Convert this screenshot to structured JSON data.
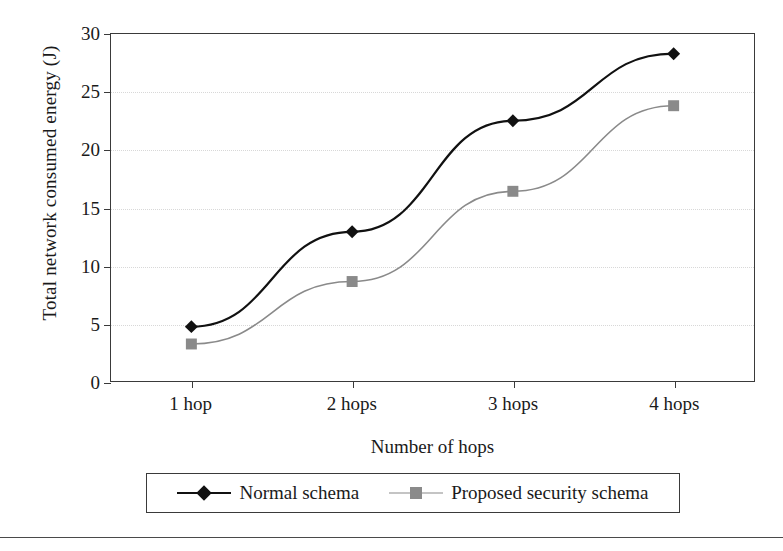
{
  "chart_data": {
    "type": "line",
    "title": "",
    "xlabel": "Number of hops",
    "ylabel": "Total network consumed energy (J)",
    "categories": [
      "1 hop",
      "2 hops",
      "3 hops",
      "4 hops"
    ],
    "ylim": [
      0,
      30
    ],
    "yticks": [
      0,
      5,
      10,
      15,
      20,
      25,
      30
    ],
    "ytick_labels": [
      "0",
      "5",
      "10",
      "15",
      "20",
      "25",
      "30"
    ],
    "grid": true,
    "grid_axis": "y",
    "legend_position": "below-plot",
    "series": [
      {
        "name": "Normal schema",
        "values": [
          4.7,
          12.9,
          22.5,
          28.3
        ],
        "color": "#111111",
        "marker": "diamond"
      },
      {
        "name": "Proposed security schema",
        "values": [
          3.2,
          8.6,
          16.4,
          23.8
        ],
        "color": "#8a8a8a",
        "marker": "square"
      }
    ]
  }
}
